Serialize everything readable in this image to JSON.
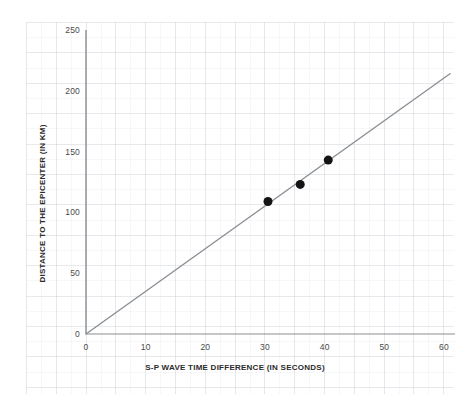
{
  "chart_data": {
    "type": "scatter",
    "title": "",
    "subtitle": "",
    "xlabel": "S-P WAVE TIME DIFFERENCE (IN SECONDS)",
    "ylabel": "DISTANCE  TO THE EPICENTER (IN KM)",
    "xlim": [
      0,
      60
    ],
    "ylim": [
      0,
      250
    ],
    "xticks": [
      0,
      10,
      20,
      30,
      40,
      50,
      60
    ],
    "yticks": [
      0,
      50,
      100,
      150,
      200,
      250
    ],
    "xtick_labels": [
      "0",
      "10",
      "20",
      "30",
      "40",
      "50",
      "60"
    ],
    "ytick_labels": [
      "0",
      "50",
      "100",
      "150",
      "200",
      "250"
    ],
    "grid": true,
    "grid_style": "graph-paper-faint",
    "legend": false,
    "legend_position": "none",
    "series": [
      {
        "name": "travel-time curve",
        "type": "line",
        "color": "#8c8f94",
        "line_width": 1.4,
        "points": [
          {
            "x": 0,
            "y": 0
          },
          {
            "x": 61,
            "y": 214
          }
        ]
      },
      {
        "name": "station readings",
        "type": "scatter",
        "color": "#141414",
        "marker": "filled-circle",
        "marker_size": 9,
        "points": [
          {
            "x": 30.5,
            "y": 109
          },
          {
            "x": 35.9,
            "y": 123
          },
          {
            "x": 40.6,
            "y": 143
          }
        ]
      }
    ],
    "annotations": []
  },
  "colors": {
    "background": "#ffffff",
    "grid": "#aab2be",
    "axis": "#8a8d92",
    "line": "#8c8f94",
    "marker": "#141414",
    "tick_text": "#4a4a4a",
    "axis_title_text": "#2b2b2b"
  }
}
